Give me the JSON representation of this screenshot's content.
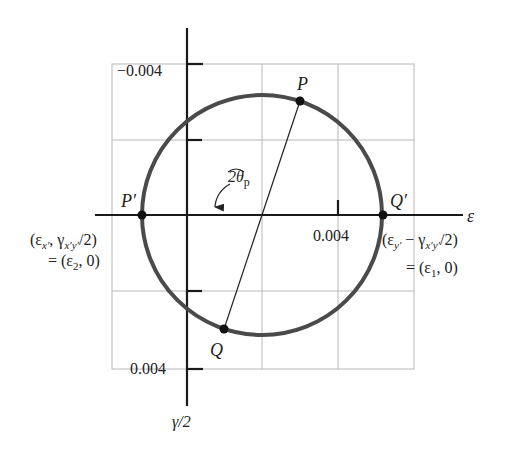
{
  "diagram": {
    "type": "mohrs-circle-strain",
    "axes": {
      "horizontal_label": "ε",
      "vertical_label": "γ/2",
      "tick_top_label": "−0.004",
      "tick_bottom_label": "0.004",
      "tick_right_label": "0.004"
    },
    "points": {
      "P": "P",
      "Q": "Q",
      "P_prime": "P′",
      "Q_prime": "Q′"
    },
    "angle_label": {
      "main": "2θ",
      "subscript": "p"
    },
    "annotations": {
      "left_line1": "(ε",
      "left_line1_sub": "x′",
      "left_line1_mid": ", γ",
      "left_line1_sub2": "x′y′",
      "left_line1_end": "/2)",
      "left_line2": "= (ε",
      "left_line2_sub": "2",
      "left_line2_end": ", 0)",
      "right_line1": "(ε",
      "right_line1_sub": "y′",
      "right_line1_mid": " − γ",
      "right_line1_sub2": "x′y′",
      "right_line1_end": "/2)",
      "right_line2": "= (ε",
      "right_line2_sub": "1",
      "right_line2_end": ", 0)"
    },
    "colors": {
      "circle": "#4a4a4a",
      "axis": "#1a1a1a",
      "grid": "#b8b8b8"
    }
  }
}
